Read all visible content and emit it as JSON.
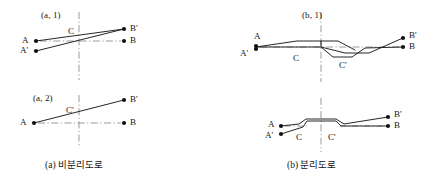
{
  "figure": {
    "width": 433,
    "height": 191,
    "background_color": "#ffffff",
    "line_color": "#1a1a1a",
    "dash_dot_color": "#8a8a8a",
    "node_color": "#111111"
  },
  "panels": [
    {
      "id": "a",
      "caption": "(a) 비분리도로",
      "subpanels": [
        {
          "id": "a1",
          "tag": "(a, 1)",
          "node_labels": [
            "A",
            "A'",
            "B'",
            "B"
          ],
          "center_labels": [
            "C"
          ]
        },
        {
          "id": "a2",
          "tag": "(a, 2)",
          "node_labels": [
            "A",
            "B'",
            "B"
          ],
          "center_labels": [
            "C'"
          ]
        }
      ]
    },
    {
      "id": "b",
      "caption": "(b) 분리도로",
      "subpanels": [
        {
          "id": "b1",
          "tag": "(b, 1)",
          "node_labels": [
            "A",
            "A'",
            "B'",
            "B"
          ],
          "center_labels": [
            "C",
            "C'"
          ]
        },
        {
          "id": "b2",
          "tag": "",
          "node_labels": [
            "A",
            "A'",
            "B'",
            "B"
          ],
          "center_labels": [
            "C",
            "C'"
          ]
        }
      ]
    }
  ],
  "labels": {
    "a1_tag": "(a, 1)",
    "a1_A": "A",
    "a1_Ap": "A'",
    "a1_Bp": "B'",
    "a1_B": "B",
    "a1_C": "C",
    "a2_tag": "(a, 2)",
    "a2_A": "A",
    "a2_Bp": "B'",
    "a2_B": "B",
    "a2_Cp": "C'",
    "a_caption": "(a) 비분리도로",
    "b1_tag": "(b, 1)",
    "b1_A": "A",
    "b1_Ap": "A'",
    "b1_Bp": "B'",
    "b1_B": "B",
    "b1_C": "C",
    "b1_Cp": "C'",
    "b2_A": "A",
    "b2_Ap": "A'",
    "b2_Bp": "B'",
    "b2_B": "B",
    "b2_C": "C",
    "b2_Cp": "C'",
    "b_caption": "(b) 분리도로"
  }
}
